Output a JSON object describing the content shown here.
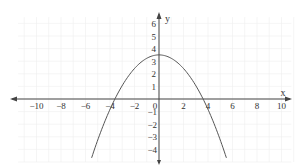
{
  "chart_data": {
    "type": "line",
    "title": "",
    "xlabel": "x",
    "ylabel": "y",
    "xlim": [
      -10,
      10
    ],
    "ylim": [
      -4,
      6
    ],
    "grid": true,
    "x_ticks": [
      -10,
      -8,
      -6,
      -4,
      -2,
      0,
      2,
      4,
      6,
      8,
      10
    ],
    "y_ticks": [
      -4,
      -3,
      -2,
      -1,
      1,
      2,
      3,
      4,
      5,
      6
    ],
    "series": [
      {
        "name": "parabola",
        "equation": "y = 3.5 - 0.27x^2",
        "vertex": [
          0,
          3.5
        ],
        "x_intercepts": [
          -3.6,
          3.6
        ],
        "x": [
          -5.5,
          -5,
          -4,
          -3,
          -2,
          -1,
          0,
          1,
          2,
          3,
          4,
          5,
          5.5
        ],
        "values": [
          -4.67,
          -3.25,
          -0.82,
          1.07,
          2.42,
          3.23,
          3.5,
          3.23,
          2.42,
          1.07,
          -0.82,
          -3.25,
          -4.67
        ]
      }
    ]
  },
  "axes": {
    "x_label": "x",
    "y_label": "y",
    "x_tick_labels": [
      "−10",
      "−8",
      "−6",
      "−4",
      "−2",
      "0",
      "2",
      "4",
      "6",
      "8",
      "10"
    ],
    "y_tick_labels_pos": [
      "1",
      "2",
      "3",
      "4",
      "5",
      "6"
    ],
    "y_tick_labels_neg": [
      "−1",
      "−2",
      "−3",
      "−4"
    ]
  },
  "colors": {
    "axis": "#444444",
    "curve": "#555555",
    "grid": "#efefef",
    "text": "#333333"
  }
}
